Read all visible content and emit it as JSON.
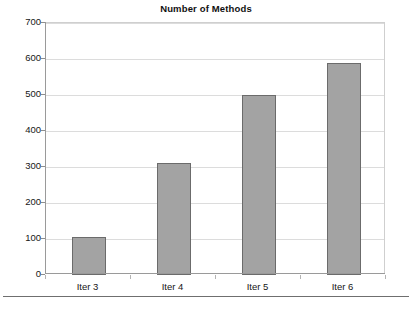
{
  "chart_data": {
    "type": "bar",
    "title": "Number of Methods",
    "xlabel": "",
    "ylabel": "",
    "categories": [
      "Iter 3",
      "Iter 4",
      "Iter 5",
      "Iter 6"
    ],
    "values": [
      105,
      310,
      500,
      590
    ],
    "ylim": [
      0,
      700
    ],
    "ytick_labels": [
      "0",
      "100",
      "200",
      "300",
      "400",
      "500",
      "600",
      "700"
    ],
    "ytick_values": [
      0,
      100,
      200,
      300,
      400,
      500,
      600,
      700
    ],
    "grid": true,
    "legend": false,
    "bar_fill_color": "#a3a3a3",
    "bar_border_color": "#6b6b6b",
    "gridline_color": "#dcdcdc",
    "axis_color": "#9a9a9a",
    "background_color": "#ffffff"
  }
}
